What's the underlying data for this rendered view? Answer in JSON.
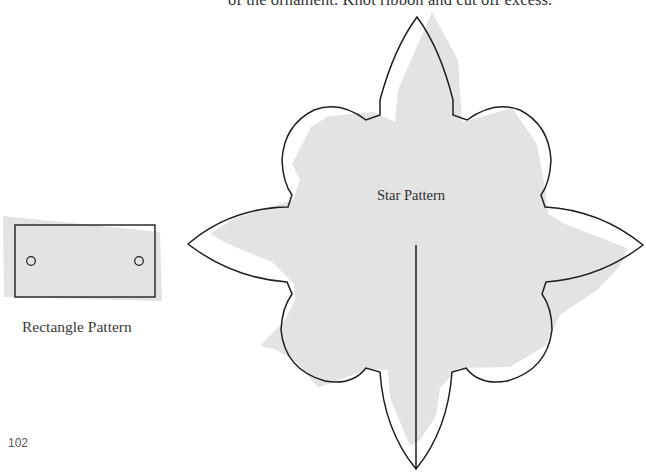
{
  "page": {
    "instruction_text_fragment": "of the ornament. Knot ribbon and cut off excess.",
    "page_number": "102"
  },
  "figures": {
    "rectangle_pattern": {
      "label": "Rectangle Pattern",
      "holes": 2
    },
    "star_pattern": {
      "label": "Star Pattern",
      "points": 4,
      "lobes": 4,
      "has_cut_line": true
    }
  },
  "colors": {
    "outline": "#1e1e1e",
    "fill_shadow": "#e3e3e3",
    "background": "#ffffff"
  }
}
